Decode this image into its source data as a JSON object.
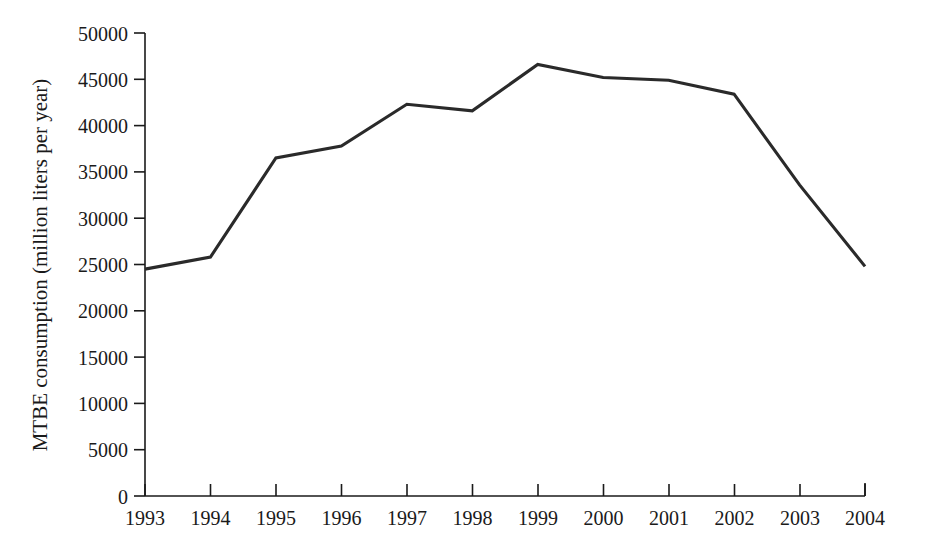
{
  "chart_data": {
    "type": "line",
    "title": "",
    "subtitle": "",
    "xlabel": "",
    "ylabel": "MTBE consumption (million liters per year)",
    "categories": [
      "1993",
      "1994",
      "1995",
      "1996",
      "1997",
      "1998",
      "1999",
      "2000",
      "2001",
      "2002",
      "2003",
      "2004"
    ],
    "x": [
      1993,
      1994,
      1995,
      1996,
      1997,
      1998,
      1999,
      2000,
      2001,
      2002,
      2003,
      2004
    ],
    "values": [
      24500,
      25800,
      36500,
      37800,
      42300,
      41600,
      46600,
      45200,
      44900,
      43400,
      33600,
      24800
    ],
    "series": [
      {
        "name": "MTBE consumption",
        "values": [
          24500,
          25800,
          36500,
          37800,
          42300,
          41600,
          46600,
          45200,
          44900,
          43400,
          33600,
          24800
        ]
      }
    ],
    "ylim": [
      0,
      50000
    ],
    "xlim": [
      1993,
      2004
    ],
    "y_ticks": [
      0,
      5000,
      10000,
      15000,
      20000,
      25000,
      30000,
      35000,
      40000,
      45000,
      50000
    ],
    "y_tick_labels": [
      "0",
      "5000",
      "10000",
      "15000",
      "20000",
      "25000",
      "30000",
      "35000",
      "40000",
      "45000",
      "50000"
    ],
    "x_ticks": [
      1993,
      1994,
      1995,
      1996,
      1997,
      1998,
      1999,
      2000,
      2001,
      2002,
      2003,
      2004
    ],
    "x_tick_labels": [
      "1993",
      "1994",
      "1995",
      "1996",
      "1997",
      "1998",
      "1999",
      "2000",
      "2001",
      "2002",
      "2003",
      "2004"
    ],
    "grid": false,
    "legend": false,
    "legend_position": "none",
    "annotations": [],
    "colors": {
      "line": "#2a2a2a",
      "axis": "#1a1a1a",
      "background": "#ffffff",
      "text": "#1a1a1a"
    }
  }
}
